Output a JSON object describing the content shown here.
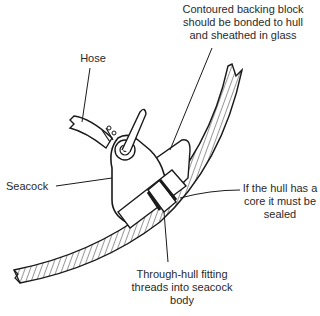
{
  "diagram": {
    "labels": {
      "backing_block": [
        "Contoured backing block",
        "should be bonded to hull",
        "and sheathed in glass"
      ],
      "hose": "Hose",
      "seacock": "Seacock",
      "core": [
        "If the hull has a",
        "core it must be",
        "sealed"
      ],
      "through_hull": [
        "Through-hull fitting",
        "threads into seacock",
        "body"
      ]
    },
    "colors": {
      "ink": "#1a1a1a",
      "text": "#2a2a2a"
    }
  }
}
